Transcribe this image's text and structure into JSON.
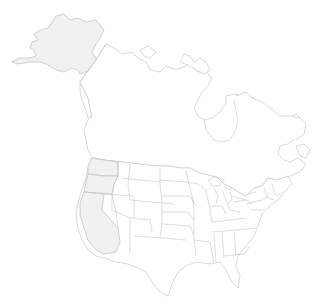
{
  "map": {
    "type": "outline-map",
    "region": "North America (United States and Canada)",
    "background_color": "#ffffff",
    "outline_color": "#c8c8c8",
    "highlight_fill": "#f1f1f1",
    "highlighted_regions": [
      "Alaska",
      "Washington",
      "Oregon",
      "California"
    ],
    "regions": [
      "Alaska",
      "Canada",
      "Contiguous United States"
    ]
  }
}
